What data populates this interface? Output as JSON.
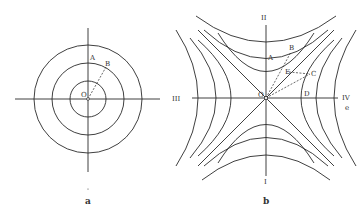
{
  "panel_a": {
    "caption": "a",
    "origin_label": "O",
    "point_labels": [
      "A",
      "B"
    ],
    "center": [
      88,
      99
    ],
    "circle_radii": [
      18,
      36,
      54
    ],
    "axis_h": [
      15,
      160
    ],
    "axis_v": [
      28,
      172
    ],
    "line_color": "#2a2a2a"
  },
  "panel_b": {
    "caption": "b",
    "origin_label": "O",
    "point_labels": [
      "A",
      "B",
      "E",
      "C",
      "D"
    ],
    "axis_labels": {
      "top": "II",
      "bottom": "I",
      "left": "III",
      "right": "IV",
      "right_sub": "e"
    },
    "center": [
      266,
      98
    ],
    "vertical_hyperbola_vertices": [
      18,
      37,
      55
    ],
    "horizontal_hyperbola_vertices": [
      37,
      58,
      80
    ],
    "line_color": "#2a2a2a"
  }
}
